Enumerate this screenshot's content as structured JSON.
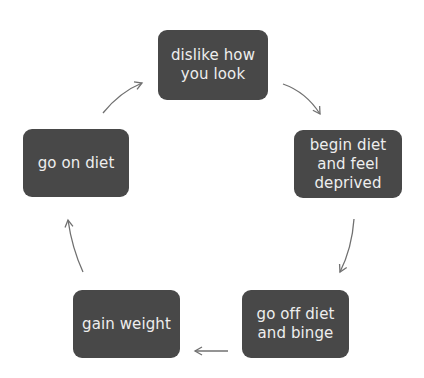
{
  "diagram": {
    "type": "cycle",
    "colors": {
      "node_fill": "#484848",
      "node_text": "#eeeeee",
      "arrow": "#707070",
      "background": "#ffffff"
    },
    "nodes": [
      {
        "id": "dislike",
        "label": "dislike how you look"
      },
      {
        "id": "begin",
        "label": "begin diet and feel deprived"
      },
      {
        "id": "gooff",
        "label": "go off diet and binge"
      },
      {
        "id": "gain",
        "label": "gain weight"
      },
      {
        "id": "goon",
        "label": "go on diet"
      }
    ],
    "edges": [
      {
        "from": "dislike",
        "to": "begin"
      },
      {
        "from": "begin",
        "to": "gooff"
      },
      {
        "from": "gooff",
        "to": "gain"
      },
      {
        "from": "gain",
        "to": "goon"
      },
      {
        "from": "goon",
        "to": "dislike"
      }
    ]
  }
}
